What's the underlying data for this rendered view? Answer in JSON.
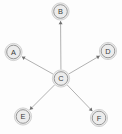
{
  "diagram": {
    "type": "node-link-diagram",
    "layout": "star",
    "canvas": {
      "width": 122,
      "height": 134,
      "background": "#fdfdfd"
    },
    "style": {
      "node_fill": "#ececec",
      "node_outer_stroke": "#c9c9c9",
      "node_ring_stroke": "#8c8c8c",
      "node_label_color": "#3a3a3a",
      "edge_color": "#a8a8a8",
      "arrow_color": "#6f6f6f",
      "node_radius": 8.6,
      "node_ring_radius": 6.8,
      "edge_width": 0.9
    },
    "nodes": [
      {
        "id": "A",
        "label": "A",
        "cx": 13.5,
        "cy": 52.0,
        "role": "leaf"
      },
      {
        "id": "B",
        "label": "B",
        "cx": 60.5,
        "cy": 11.5,
        "role": "leaf"
      },
      {
        "id": "C",
        "label": "C",
        "cx": 61.0,
        "cy": 78.5,
        "role": "hub"
      },
      {
        "id": "D",
        "label": "D",
        "cx": 108.0,
        "cy": 51.0,
        "role": "leaf"
      },
      {
        "id": "E",
        "label": "E",
        "cx": 23.0,
        "cy": 116.5,
        "role": "leaf"
      },
      {
        "id": "F",
        "label": "F",
        "cx": 99.0,
        "cy": 118.0,
        "role": "leaf"
      }
    ],
    "edges": [
      {
        "id": "C-A",
        "from": "C",
        "to": "A",
        "directed": true
      },
      {
        "id": "C-B",
        "from": "C",
        "to": "B",
        "directed": true
      },
      {
        "id": "C-D",
        "from": "C",
        "to": "D",
        "directed": true
      },
      {
        "id": "C-E",
        "from": "C",
        "to": "E",
        "directed": true
      },
      {
        "id": "C-F",
        "from": "C",
        "to": "F",
        "directed": true
      }
    ]
  }
}
